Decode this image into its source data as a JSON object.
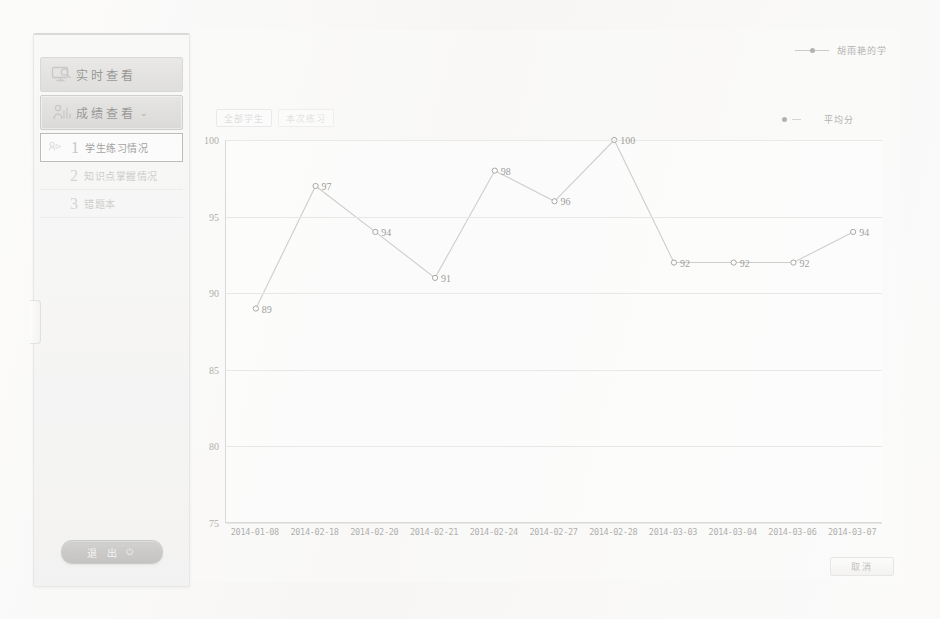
{
  "sidebar": {
    "top_items": [
      {
        "label": "实时查看",
        "icon": "monitor-icon",
        "state": "normal"
      },
      {
        "label": "成绩查看",
        "icon": "chart-person-icon",
        "state": "open",
        "chevron": "⌄"
      }
    ],
    "sub_items": [
      {
        "num": "1",
        "label": "学生练习情况",
        "icon": "student-icon",
        "selected": true
      },
      {
        "num": "2",
        "label": "知识点掌握情况",
        "icon": "",
        "selected": false
      },
      {
        "num": "3",
        "label": "错题本",
        "icon": "",
        "selected": false
      }
    ],
    "logout_label": "退 出",
    "logout_icon": "power-icon"
  },
  "chart_card": {
    "toolbar": [
      {
        "label": "全部学生",
        "name": "filter-all-students"
      },
      {
        "label": "本次练习",
        "name": "filter-current-practice"
      }
    ],
    "cancel_label": "取消"
  },
  "chart_data": {
    "type": "line",
    "title": "",
    "xlabel": "",
    "ylabel": "",
    "ylim": [
      75,
      100
    ],
    "yticks": [
      100,
      95,
      90,
      85,
      80,
      75
    ],
    "grid": true,
    "legend_position": "top-right",
    "legend": [
      {
        "name": "胡雨艳的学",
        "marker": "line-circle",
        "color": "#8f8e8b"
      },
      {
        "name": "平均分",
        "marker": "dot",
        "color": "#8f8e8b"
      }
    ],
    "categories": [
      "2014-01-08",
      "2014-02-18",
      "2014-02-20",
      "2014-02-21",
      "2014-02-24",
      "2014-02-27",
      "2014-02-28",
      "2014-03-03",
      "2014-03-04",
      "2014-03-06",
      "2014-03-07"
    ],
    "series": [
      {
        "name": "胡雨艳的学",
        "values": [
          89,
          97,
          94,
          91,
          98,
          96,
          100,
          92,
          92,
          92,
          94
        ]
      }
    ],
    "point_labels": [
      "89",
      "97",
      "94",
      "91",
      "98",
      "96",
      "100",
      "92",
      "92",
      "92",
      "94"
    ]
  }
}
